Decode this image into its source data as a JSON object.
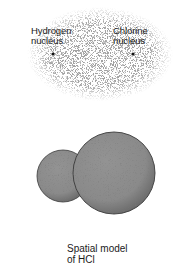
{
  "electron_cloud": {
    "hydrogen_label_line1": "Hydrogen",
    "hydrogen_label_line2": "nucleus",
    "chlorine_label_line1": "Chlorine",
    "chlorine_label_line2": "nucleus"
  },
  "spatial_model": {
    "caption_line1": "Spatial model",
    "caption_line2": "of HCl"
  },
  "colors": {
    "cloud_dots": "#707070",
    "sphere_fill": "#8a8a8a",
    "sphere_outline": "#3a3a3a",
    "text": "#1a1a1a"
  }
}
